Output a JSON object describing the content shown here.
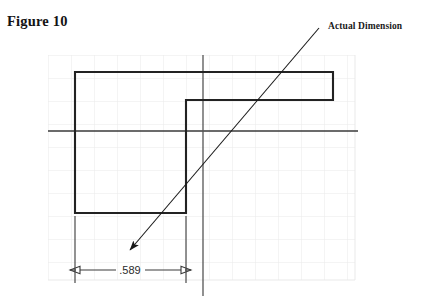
{
  "figure": {
    "title": "Figure 10",
    "callout_label": "Actual Dimension",
    "dimension_value": ".589"
  },
  "colors": {
    "background": "#ffffff",
    "grid_line": "#e9e9e9",
    "object_line": "#222222",
    "center_line": "#3a3a3a",
    "dimension_line": "#3a3a3a",
    "leader_line": "#1a1a1a",
    "text": "#141414"
  },
  "drawing": {
    "grid": {
      "x": 48,
      "y": 55,
      "width": 307,
      "height": 225,
      "spacing": 23
    },
    "profile_outline": "75,72 333,72 333,100 186,100 186,213 75,213",
    "center_lines": {
      "horizontal": {
        "x1": 48,
        "y1": 131,
        "x2": 358,
        "y2": 131
      },
      "vertical": {
        "x1": 203,
        "y1": 55,
        "x2": 203,
        "y2": 296
      }
    },
    "leader": {
      "start_x": 319,
      "start_y": 28,
      "end_x": 130,
      "end_y": 250
    },
    "dimension": {
      "left_x": 75,
      "right_x": 186,
      "line_y": 270,
      "ext_top_y": 216,
      "ext_bottom_y": 283,
      "text_x": 130,
      "text_y": 274
    }
  }
}
